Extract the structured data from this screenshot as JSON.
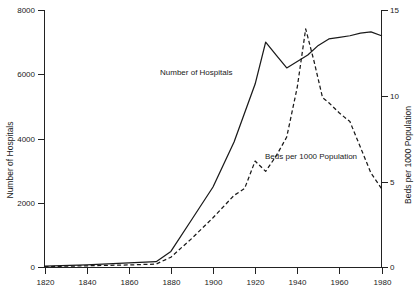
{
  "chart_data": {
    "type": "line",
    "title": "",
    "xlabel": "",
    "grid": false,
    "legend_position": "inline-annotations",
    "xlim": [
      1820,
      1980
    ],
    "x_ticks": [
      1820,
      1840,
      1860,
      1880,
      1900,
      1920,
      1940,
      1960,
      1980
    ],
    "x_tick_labels": [
      "1820",
      "1840",
      "1860",
      "1880",
      "1900",
      "1920",
      "1940",
      "1960",
      "1980"
    ],
    "axes": [
      {
        "id": "left",
        "label": "Number of Hospitals",
        "ylim": [
          0,
          8000
        ],
        "ticks": [
          0,
          2000,
          4000,
          6000,
          8000
        ],
        "tick_labels": [
          "0",
          "2000",
          "4000",
          "6000",
          "8000"
        ]
      },
      {
        "id": "right",
        "label": "Beds per 1000 Population",
        "ylim": [
          0,
          15
        ],
        "ticks": [
          0,
          5,
          10,
          15
        ],
        "tick_labels": [
          "0",
          "5",
          "10",
          "15"
        ]
      }
    ],
    "series": [
      {
        "name": "Number of Hospitals",
        "axis": "left",
        "style": "solid",
        "annotation": "Number of Hospitals",
        "x": [
          1820,
          1840,
          1860,
          1873,
          1880,
          1890,
          1900,
          1910,
          1920,
          1925,
          1930,
          1935,
          1940,
          1945,
          1950,
          1955,
          1960,
          1965,
          1970,
          1975,
          1980
        ],
        "values": [
          40,
          80,
          140,
          180,
          500,
          1500,
          2500,
          3900,
          5700,
          7000,
          6600,
          6200,
          6400,
          6600,
          6900,
          7100,
          7150,
          7200,
          7280,
          7320,
          7200
        ]
      },
      {
        "name": "Beds per 1000 Population",
        "axis": "right",
        "style": "dashed",
        "annotation": "Beds per 1000 Population",
        "x": [
          1820,
          1840,
          1860,
          1873,
          1880,
          1890,
          1900,
          1910,
          1915,
          1920,
          1925,
          1930,
          1935,
          1940,
          1944,
          1948,
          1952,
          1955,
          1960,
          1965,
          1970,
          1975,
          1980
        ],
        "values": [
          0.05,
          0.1,
          0.15,
          0.2,
          0.6,
          1.7,
          2.9,
          4.2,
          4.6,
          6.2,
          5.6,
          6.5,
          7.6,
          10.5,
          13.9,
          12.0,
          9.9,
          9.6,
          9.0,
          8.5,
          7.0,
          5.5,
          4.6
        ]
      }
    ]
  }
}
